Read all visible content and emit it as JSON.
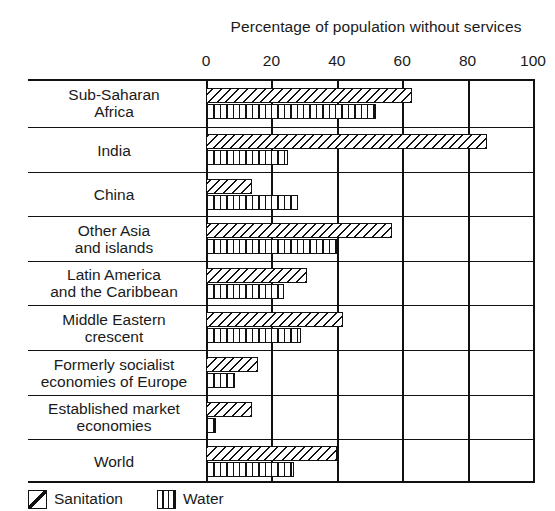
{
  "chart_data": {
    "type": "bar",
    "orientation": "horizontal",
    "title": "Percentage of population without services",
    "xlabel": "",
    "ylabel": "",
    "xlim": [
      0,
      100
    ],
    "xticks": [
      0,
      20,
      40,
      60,
      80,
      100
    ],
    "xtick_labels": [
      "0",
      "20",
      "40",
      "60",
      "80",
      "100"
    ],
    "grid": true,
    "legend_position": "bottom-left",
    "categories": [
      "Sub-Saharan Africa",
      "India",
      "China",
      "Other Asia and islands",
      "Latin America and the Caribbean",
      "Middle Eastern crescent",
      "Formerly socialist economies of Europe",
      "Established market economies",
      "World"
    ],
    "category_lines": [
      [
        "Sub-Saharan",
        "Africa"
      ],
      [
        "India"
      ],
      [
        "China"
      ],
      [
        "Other Asia",
        "and islands"
      ],
      [
        "Latin America",
        "and the Caribbean"
      ],
      [
        "Middle Eastern",
        "crescent"
      ],
      [
        "Formerly socialist",
        "economies of Europe"
      ],
      [
        "Established market",
        "economies"
      ],
      [
        "World"
      ]
    ],
    "series": [
      {
        "name": "Sanitation",
        "pattern": "diagonal-hatch",
        "values": [
          63,
          86,
          14,
          57,
          31,
          42,
          16,
          14,
          40
        ]
      },
      {
        "name": "Water",
        "pattern": "vertical-hatch",
        "values": [
          52,
          25,
          28,
          40,
          24,
          29,
          9,
          3,
          27
        ]
      }
    ]
  },
  "legend": {
    "items": [
      {
        "label": "Sanitation",
        "pattern": "diagonal-hatch"
      },
      {
        "label": "Water",
        "pattern": "vertical-hatch"
      }
    ]
  },
  "colors": {
    "ink": "#111111",
    "background": "#ffffff"
  }
}
